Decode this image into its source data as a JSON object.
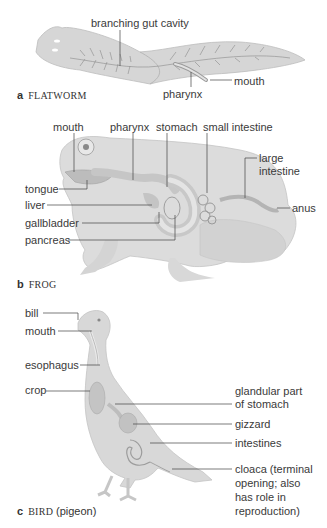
{
  "figure": {
    "panels": [
      {
        "letter": "a",
        "name": "FLATWORM",
        "subtitle": "",
        "labels": [
          "branching gut cavity",
          "mouth",
          "pharynx"
        ]
      },
      {
        "letter": "b",
        "name": "FROG",
        "subtitle": "",
        "labels": [
          "mouth",
          "pharynx",
          "stomach",
          "small intestine",
          "large intestine",
          "tongue",
          "liver",
          "gallbladder",
          "pancreas",
          "anus"
        ]
      },
      {
        "letter": "c",
        "name": "BIRD",
        "subtitle": "(pigeon)",
        "labels": [
          "bill",
          "mouth",
          "esophagus",
          "crop",
          "glandular part of stomach",
          "gizzard",
          "intestines",
          "cloaca (terminal opening; also has role in reproduction)"
        ]
      }
    ]
  },
  "flatworm": {
    "letter": "a",
    "name": "FLATWORM",
    "branching_gut_cavity": "branching gut cavity",
    "mouth": "mouth",
    "pharynx": "pharynx"
  },
  "frog": {
    "letter": "b",
    "name": "FROG",
    "mouth": "mouth",
    "pharynx": "pharynx",
    "stomach": "stomach",
    "small_intestine": "small intestine",
    "large_intestine_1": "large",
    "large_intestine_2": "intestine",
    "tongue": "tongue",
    "liver": "liver",
    "gallbladder": "gallbladder",
    "pancreas": "pancreas",
    "anus": "anus"
  },
  "bird": {
    "letter": "c",
    "name": "BIRD",
    "subtitle": "(pigeon)",
    "bill": "bill",
    "mouth": "mouth",
    "esophagus": "esophagus",
    "crop": "crop",
    "glandular_1": "glandular part",
    "glandular_2": "of stomach",
    "gizzard": "gizzard",
    "intestines": "intestines",
    "cloaca_1": "cloaca (terminal",
    "cloaca_2": "opening; also",
    "cloaca_3": "has role in",
    "cloaca_4": "reproduction)"
  }
}
